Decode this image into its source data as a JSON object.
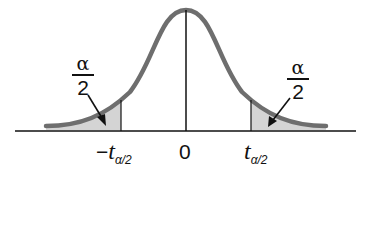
{
  "diagram": {
    "type": "t-distribution two-tailed rejection regions",
    "colors": {
      "curve": "#6e6e6e",
      "axis": "#111111",
      "shade": "#d4d4d4",
      "arrow": "#111111"
    },
    "left_tail": {
      "fraction_numerator": "α",
      "fraction_denominator": "2"
    },
    "right_tail": {
      "fraction_numerator": "α",
      "fraction_denominator": "2"
    },
    "ticks": {
      "left_sign": "−",
      "left_var": "t",
      "left_sub": "α/2",
      "center": "0",
      "right_var": "t",
      "right_sub": "α/2"
    }
  }
}
